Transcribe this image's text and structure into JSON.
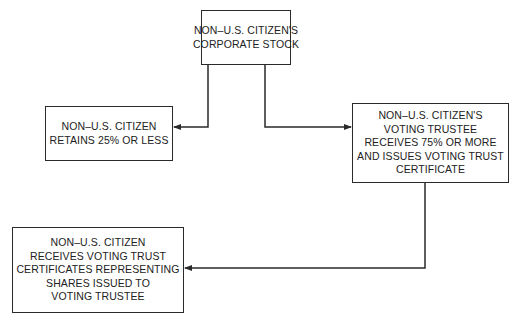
{
  "diagram": {
    "type": "flowchart",
    "nodes": [
      {
        "id": "stock",
        "lines": [
          "NON–U.S. CITIZEN'S",
          "CORPORATE STOCK"
        ]
      },
      {
        "id": "retains",
        "lines": [
          "NON–U.S. CITIZEN",
          "RETAINS 25% OR LESS"
        ]
      },
      {
        "id": "trustee",
        "lines": [
          "NON–U.S. CITIZEN'S",
          "VOTING TRUSTEE",
          "RECEIVES 75% OR MORE",
          "AND ISSUES VOTING TRUST",
          "CERTIFICATE"
        ]
      },
      {
        "id": "receives",
        "lines": [
          "NON–U.S. CITIZEN",
          "RECEIVES VOTING TRUST",
          "CERTIFICATES REPRESENTING",
          "SHARES ISSUED TO",
          "VOTING TRUSTEE"
        ]
      }
    ],
    "edges": [
      {
        "from": "stock",
        "to": "retains"
      },
      {
        "from": "stock",
        "to": "trustee"
      },
      {
        "from": "trustee",
        "to": "receives"
      }
    ],
    "colors": {
      "line": "#2a2a2a",
      "text": "#222222",
      "background": "#ffffff"
    }
  }
}
